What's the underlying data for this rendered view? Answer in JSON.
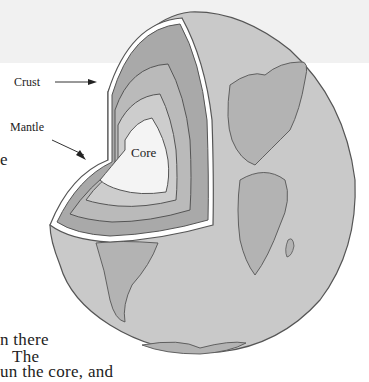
{
  "figure": {
    "labels": {
      "crust": "Crust",
      "mantle": "Mantle",
      "core": "Core"
    }
  },
  "text_fragments": {
    "left_edge_char": "e",
    "line1": "n there",
    "line2": "The",
    "line3": "un the core, and"
  },
  "colors": {
    "background": "#ffffff",
    "top_band": "#f1f1f1",
    "globe_surface": "#c9c9c9",
    "continents": "#b0b0b0",
    "crust_layer": "#a9a9a9",
    "mantle_outer": "#b9b9b9",
    "mantle_inner": "#cdcdcd",
    "core": "#f3f3f3",
    "outline": "#555555"
  }
}
